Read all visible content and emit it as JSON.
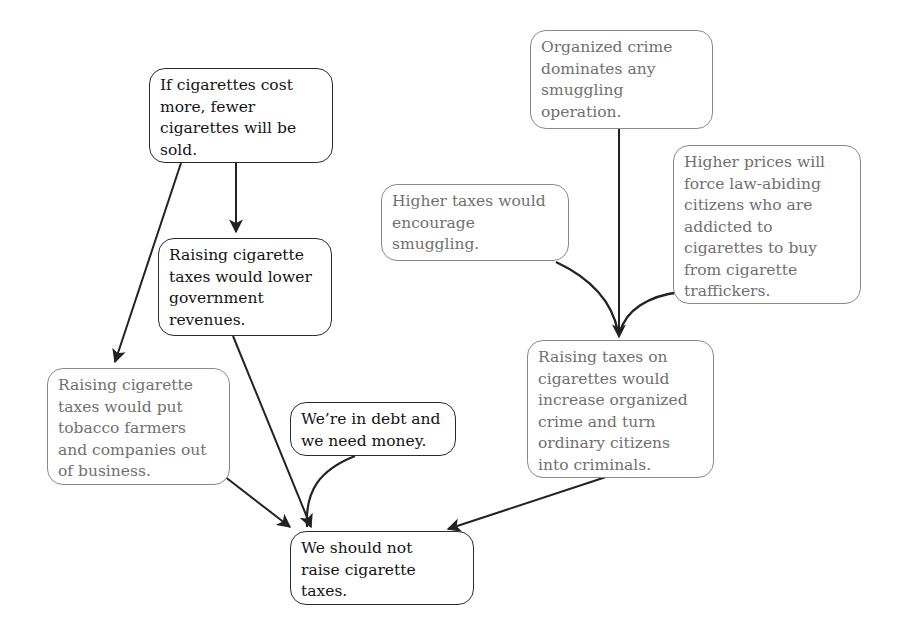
{
  "diagram": {
    "type": "argument-map",
    "colors": {
      "primary_text": "#141414",
      "primary_border": "#2a2a2a",
      "secondary_text": "#707070",
      "secondary_border": "#8a8a8a",
      "edge": "#222222"
    },
    "nodes": {
      "n1": {
        "text": "If cigarettes cost\nmore, fewer\ncigarettes will be\nsold.",
        "style": "primary"
      },
      "n2": {
        "text": "Raising cigarette\ntaxes would lower\ngovernment\nrevenues.",
        "style": "primary"
      },
      "n3": {
        "text": "Raising cigarette\ntaxes would put\ntobacco farmers\nand companies out\nof business.",
        "style": "secondary"
      },
      "n4": {
        "text": "We’re in debt and\nwe need money.",
        "style": "primary"
      },
      "n5": {
        "text": "We should not\nraise cigarette\ntaxes.",
        "style": "primary"
      },
      "n6": {
        "text": "Organized crime\ndominates any\nsmuggling\noperation.",
        "style": "secondary"
      },
      "n7": {
        "text": "Higher taxes would\nencourage\nsmuggling.",
        "style": "secondary"
      },
      "n8": {
        "text": "Higher prices will\nforce law-abiding\ncitizens who are\naddicted to\ncigarettes to buy\nfrom cigarette\ntraffickers.",
        "style": "secondary"
      },
      "n9": {
        "text": "Raising taxes on\ncigarettes would\nincrease organized\ncrime and turn\nordinary citizens\ninto criminals.",
        "style": "secondary"
      }
    },
    "edges": [
      {
        "from": "n1",
        "to": "n2"
      },
      {
        "from": "n1",
        "to": "n3"
      },
      {
        "from": "n2",
        "to": "n5"
      },
      {
        "from": "n4",
        "to": "n5",
        "linked_with": "n2"
      },
      {
        "from": "n3",
        "to": "n5"
      },
      {
        "from": "n9",
        "to": "n5"
      },
      {
        "from": "n6",
        "to": "n9"
      },
      {
        "from": "n7",
        "to": "n9",
        "linked_with": "n6"
      },
      {
        "from": "n8",
        "to": "n9",
        "linked_with": "n6"
      }
    ]
  }
}
